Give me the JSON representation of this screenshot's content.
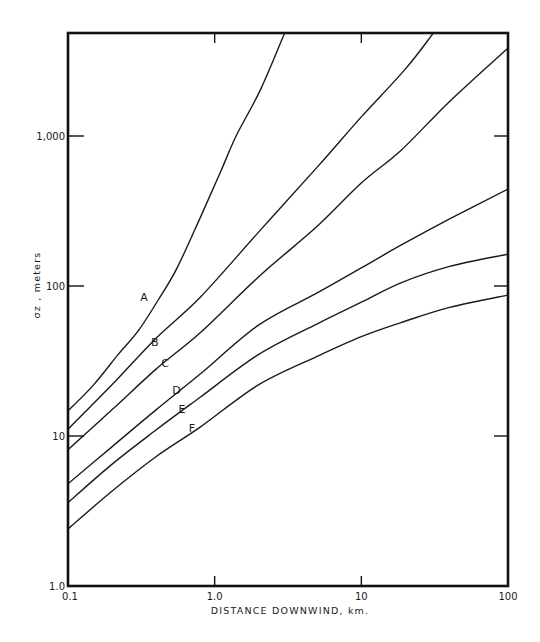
{
  "chart_data": {
    "type": "line",
    "title": "",
    "xlabel": "DISTANCE DOWNWIND, km.",
    "ylabel": "σz , meters",
    "xscale": "log",
    "yscale": "log",
    "xlim": [
      0.1,
      100
    ],
    "ylim": [
      1.0,
      5000
    ],
    "grid": false,
    "legend": "inline curve labels",
    "x_ticks": [
      {
        "value": 0.1,
        "label": "0.1"
      },
      {
        "value": 1,
        "label": "1.0"
      },
      {
        "value": 10,
        "label": "10"
      },
      {
        "value": 100,
        "label": "100"
      }
    ],
    "y_ticks": [
      {
        "value": 1,
        "label": "1.0"
      },
      {
        "value": 10,
        "label": "10"
      },
      {
        "value": 100,
        "label": "100"
      },
      {
        "value": 1000,
        "label": "1,000"
      }
    ],
    "series": [
      {
        "name": "A",
        "label_pos": [
          0.33,
          80
        ],
        "points": [
          [
            0.1,
            14.7
          ],
          [
            0.15,
            22
          ],
          [
            0.22,
            35
          ],
          [
            0.3,
            50
          ],
          [
            0.41,
            80
          ],
          [
            0.55,
            130
          ],
          [
            0.8,
            288
          ],
          [
            1.1,
            580
          ],
          [
            1.4,
            1000
          ],
          [
            2.05,
            2030
          ],
          [
            3.0,
            4850
          ]
        ]
      },
      {
        "name": "B",
        "label_pos": [
          0.39,
          40
        ],
        "points": [
          [
            0.1,
            11.1
          ],
          [
            0.2,
            22
          ],
          [
            0.4,
            45
          ],
          [
            0.8,
            84.5
          ],
          [
            2.05,
            236
          ],
          [
            5,
            620
          ],
          [
            10,
            1340
          ],
          [
            20,
            2800
          ],
          [
            31,
            4850
          ]
        ]
      },
      {
        "name": "C",
        "label_pos": [
          0.46,
          29
        ],
        "points": [
          [
            0.1,
            8.1
          ],
          [
            0.2,
            15
          ],
          [
            0.4,
            28
          ],
          [
            0.8,
            49
          ],
          [
            2.05,
            118
          ],
          [
            5,
            250
          ],
          [
            10,
            486
          ],
          [
            18.6,
            800
          ],
          [
            40,
            1700
          ],
          [
            100,
            3860
          ]
        ]
      },
      {
        "name": "D",
        "label_pos": [
          0.55,
          19
        ],
        "points": [
          [
            0.1,
            4.8
          ],
          [
            0.2,
            8.5
          ],
          [
            0.4,
            15
          ],
          [
            0.8,
            26
          ],
          [
            2,
            55
          ],
          [
            5,
            90
          ],
          [
            10,
            132
          ],
          [
            18.6,
            187
          ],
          [
            40,
            280
          ],
          [
            100,
            443
          ]
        ]
      },
      {
        "name": "E",
        "label_pos": [
          0.6,
          14.2
        ],
        "points": [
          [
            0.1,
            3.6
          ],
          [
            0.2,
            6.5
          ],
          [
            0.4,
            11
          ],
          [
            0.8,
            18.2
          ],
          [
            2,
            35
          ],
          [
            5,
            56
          ],
          [
            10,
            78
          ],
          [
            18.6,
            105
          ],
          [
            40,
            135
          ],
          [
            100,
            163
          ]
        ]
      },
      {
        "name": "F",
        "label_pos": [
          0.7,
          10.6
        ],
        "points": [
          [
            0.1,
            2.4
          ],
          [
            0.2,
            4.3
          ],
          [
            0.4,
            7.3
          ],
          [
            0.8,
            11.5
          ],
          [
            2,
            22
          ],
          [
            5,
            34
          ],
          [
            10,
            46
          ],
          [
            18.6,
            57
          ],
          [
            40,
            72
          ],
          [
            100,
            87
          ]
        ]
      }
    ]
  }
}
